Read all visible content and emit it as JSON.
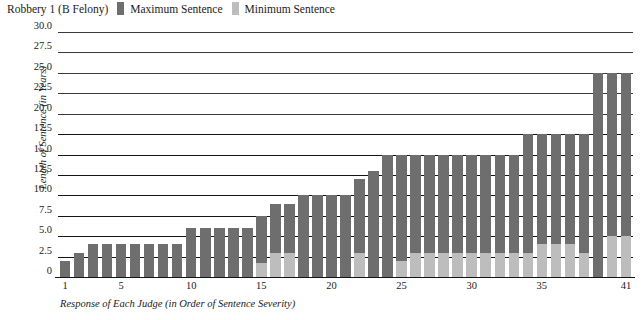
{
  "legend": {
    "title": "Robbery 1 (B Felony)",
    "entries": [
      {
        "label": "Maximum Sentence",
        "color": "#6e6e6e",
        "icon": "legend-swatch-max"
      },
      {
        "label": "Minimum Sentence",
        "color": "#bdbdbd",
        "icon": "legend-swatch-min"
      }
    ]
  },
  "chart_data": {
    "type": "bar",
    "title": "Robbery 1 (B Felony)",
    "xlabel": "Response of Each Judge (in Order of Sentence Severity)",
    "ylabel": "Length of Sentence (in Years)",
    "ylim": [
      0,
      30
    ],
    "ytick_labels": [
      "0",
      "2.5",
      "5.0",
      "7.5",
      "10.0",
      "12.5",
      "15.0",
      "17.5",
      "20.0",
      "22.5",
      "25.0",
      "27.5",
      "30.0"
    ],
    "ytick_values": [
      0,
      2.5,
      5,
      7.5,
      10,
      12.5,
      15,
      17.5,
      20,
      22.5,
      25,
      27.5,
      30
    ],
    "xtick_labels": [
      "1",
      "5",
      "10",
      "15",
      "20",
      "25",
      "30",
      "35",
      "41"
    ],
    "xtick_values": [
      1,
      5,
      10,
      15,
      20,
      25,
      30,
      35,
      41
    ],
    "grid": true,
    "legend_position": "top-left",
    "categories": [
      1,
      2,
      3,
      4,
      5,
      6,
      7,
      8,
      9,
      10,
      11,
      12,
      13,
      14,
      15,
      16,
      17,
      18,
      19,
      20,
      21,
      22,
      23,
      24,
      25,
      26,
      27,
      28,
      29,
      30,
      31,
      32,
      33,
      34,
      35,
      36,
      37,
      38,
      39,
      40,
      41
    ],
    "series": [
      {
        "name": "Maximum Sentence",
        "color": "#6e6e6e",
        "values": [
          2,
          3,
          4,
          4,
          4,
          4,
          4,
          4,
          4,
          6,
          6,
          6,
          6,
          6,
          7.5,
          9,
          9,
          10,
          10,
          10,
          10,
          12,
          13,
          15,
          15,
          15,
          15,
          15,
          15,
          15,
          15,
          15,
          15,
          17.5,
          17.5,
          17.5,
          17.5,
          17.5,
          25,
          25,
          25
        ]
      },
      {
        "name": "Minimum Sentence",
        "color": "#bdbdbd",
        "values": [
          0,
          0,
          0,
          0,
          0,
          0,
          0,
          0,
          0,
          0,
          0,
          0,
          0,
          0,
          1.7,
          3,
          3,
          0,
          0,
          0,
          0,
          3,
          0,
          0,
          2,
          3,
          3,
          3,
          3,
          3,
          3,
          3,
          3,
          3,
          4,
          4,
          4,
          3,
          0,
          5,
          5
        ]
      }
    ]
  }
}
